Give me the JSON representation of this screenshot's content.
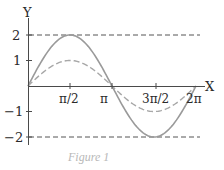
{
  "chart_data": {
    "type": "line",
    "title": "",
    "caption": "Figure 1",
    "xlabel": "X",
    "ylabel": "Y",
    "xlim": [
      0,
      6.2832
    ],
    "ylim": [
      -2,
      2
    ],
    "x_ticks": [
      {
        "value": 1.5708,
        "label": "π/2"
      },
      {
        "value": 3.1416,
        "label": "π"
      },
      {
        "value": 4.7124,
        "label": "3π/2"
      },
      {
        "value": 6.2832,
        "label": "2π"
      }
    ],
    "y_ticks": [
      {
        "value": 2,
        "label": "2"
      },
      {
        "value": 1,
        "label": "1"
      },
      {
        "value": -1,
        "label": "−1"
      },
      {
        "value": -2,
        "label": "−2"
      }
    ],
    "reference_lines": [
      {
        "y": 2,
        "style": "dashed"
      },
      {
        "y": -2,
        "style": "dashed"
      }
    ],
    "series": [
      {
        "name": "2·sin(x)",
        "style": "solid",
        "color": "#9a9a9a",
        "amplitude": 2,
        "x": [
          0,
          0.7854,
          1.5708,
          2.3562,
          3.1416,
          3.927,
          4.7124,
          5.4978,
          6.2832
        ],
        "values": [
          0,
          1.414,
          2,
          1.414,
          0,
          -1.414,
          -2,
          -1.414,
          0
        ]
      },
      {
        "name": "sin(x)",
        "style": "dashed",
        "color": "#a8a8a8",
        "amplitude": 1,
        "x": [
          0,
          0.7854,
          1.5708,
          2.3562,
          3.1416,
          3.927,
          4.7124,
          5.4978,
          6.2832
        ],
        "values": [
          0,
          0.707,
          1,
          0.707,
          0,
          -0.707,
          -1,
          -0.707,
          0
        ]
      }
    ],
    "grid": false,
    "legend": "none"
  },
  "labels": {
    "y_axis": "Y",
    "x_axis": "X",
    "y2": "2",
    "y1": "1",
    "ym1": "−1",
    "ym2": "−2",
    "x_pi2": "π/2",
    "x_pi": "π",
    "x_3pi2": "3π/2",
    "x_2pi": "2π",
    "caption": "Figure 1"
  },
  "colors": {
    "axis": "#4a4a4a",
    "curve_solid": "#9a9a9a",
    "curve_dashed": "#a8a8a8",
    "ref_dashed": "#555555",
    "caption": "#b8b8b8"
  }
}
